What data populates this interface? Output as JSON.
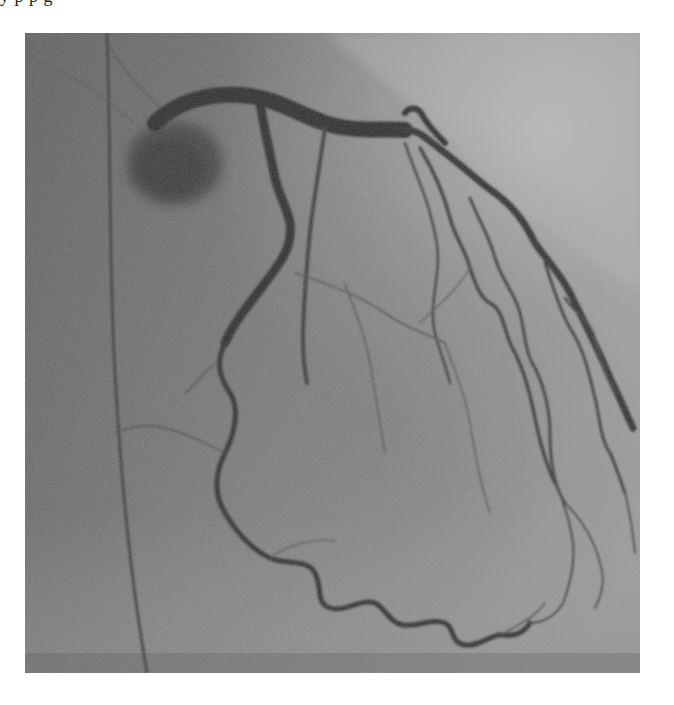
{
  "page": {
    "background": "#ffffff",
    "top_clipped_text": "y    p    p    g"
  },
  "figure": {
    "type": "coronary-angiogram",
    "modality": "X-ray fluoroscopy (grayscale)",
    "bounds": {
      "x": 25,
      "y": 33,
      "width": 615,
      "height": 640
    },
    "colors": {
      "background_dark": "#5e5e5e",
      "background_mid": "#7c7c7c",
      "background_light": "#b4b4b4",
      "vessel": "#2b2b2b",
      "vessel_faint": "#4a4a4a"
    },
    "structures": [
      {
        "name": "guiding-catheter-wire",
        "description": "thin near-vertical dark line on left side"
      },
      {
        "name": "aortic-root-contrast",
        "description": "dark rounded contrast blush at upper left"
      },
      {
        "name": "left-main-artery",
        "description": "thick vessel arcing to upper right"
      },
      {
        "name": "left-anterior-descending",
        "description": "vessel along upper-right cardiac border with diagonal branches"
      },
      {
        "name": "left-circumflex",
        "description": "tortuous vessel descending down center-left and across bottom"
      },
      {
        "name": "diagonal-branches",
        "description": "multiple thin winding branches toward lower right"
      }
    ]
  }
}
